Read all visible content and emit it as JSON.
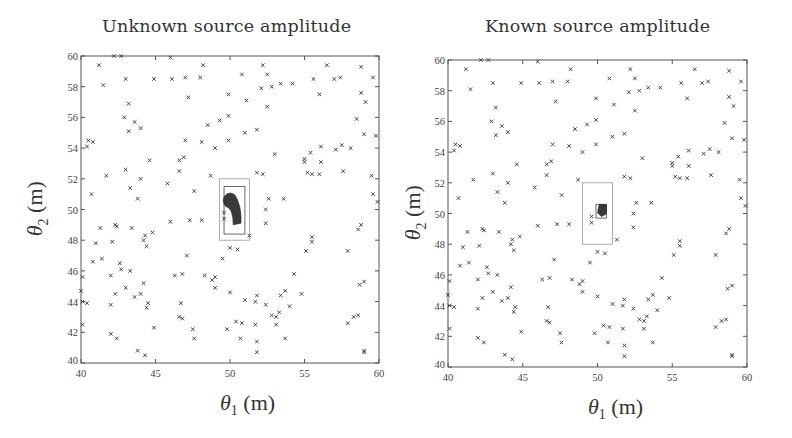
{
  "chart_data": [
    {
      "type": "scatter",
      "title": "Unknown source amplitude",
      "xlabel": "θ1 (m)",
      "ylabel": "θ2 (m)",
      "xlim": [
        40,
        60
      ],
      "ylim": [
        40,
        60
      ],
      "xticks": [
        40,
        45,
        50,
        55,
        60
      ],
      "yticks": [
        40,
        42,
        44,
        46,
        48,
        50,
        52,
        54,
        56,
        58,
        60
      ],
      "grid": false,
      "marker": "x",
      "series": [
        {
          "name": "sensors",
          "marker": "x",
          "points": "shared_sensors"
        }
      ],
      "outer_box": {
        "x": [
          49.3,
          51.3
        ],
        "y": [
          48.0,
          52.0
        ]
      },
      "inner_box": {
        "x": [
          49.6,
          51.0
        ],
        "y": [
          48.4,
          51.5
        ]
      },
      "posterior_region": {
        "center": [
          50.1,
          50.2
        ],
        "extent_x": [
          49.5,
          50.8
        ],
        "extent_y": [
          49.0,
          51.2
        ],
        "shape": "curved-crescent"
      }
    },
    {
      "type": "scatter",
      "title": "Known source amplitude",
      "xlabel": "θ1 (m)",
      "ylabel": "θ2 (m)",
      "xlim": [
        40,
        60
      ],
      "ylim": [
        40,
        60
      ],
      "xticks": [
        40,
        45,
        50,
        55,
        60
      ],
      "yticks": [
        40,
        42,
        44,
        46,
        48,
        50,
        52,
        54,
        56,
        58,
        60
      ],
      "grid": false,
      "marker": "x",
      "series": [
        {
          "name": "sensors",
          "marker": "x",
          "points": "shared_sensors"
        }
      ],
      "outer_box": {
        "x": [
          49.0,
          51.0
        ],
        "y": [
          48.0,
          52.0
        ]
      },
      "inner_box": {
        "x": [
          49.9,
          50.6
        ],
        "y": [
          49.7,
          50.6
        ]
      },
      "posterior_region": {
        "center": [
          50.3,
          50.1
        ],
        "extent_x": [
          50.0,
          50.6
        ],
        "extent_y": [
          49.8,
          50.6
        ],
        "shape": "compact-blob"
      }
    }
  ],
  "shared_sensors": [
    [
      41.2,
      59.4
    ],
    [
      42.2,
      60.0
    ],
    [
      42.7,
      60.0
    ],
    [
      46.0,
      59.9
    ],
    [
      48.2,
      59.4
    ],
    [
      52.2,
      59.4
    ],
    [
      56.5,
      59.4
    ],
    [
      58.8,
      59.3
    ],
    [
      41.5,
      58.1
    ],
    [
      43.0,
      58.5
    ],
    [
      44.9,
      58.5
    ],
    [
      46.1,
      58.5
    ],
    [
      47.0,
      58.6
    ],
    [
      48.0,
      58.6
    ],
    [
      50.8,
      58.8
    ],
    [
      52.5,
      58.8
    ],
    [
      52.1,
      57.9
    ],
    [
      52.8,
      58.0
    ],
    [
      53.4,
      58.2
    ],
    [
      54.2,
      58.2
    ],
    [
      55.6,
      58.5
    ],
    [
      57.0,
      58.5
    ],
    [
      59.6,
      58.6
    ],
    [
      56.0,
      57.5
    ],
    [
      49.9,
      57.5
    ],
    [
      51.1,
      57.1
    ],
    [
      47.2,
      57.3
    ],
    [
      43.2,
      56.9
    ],
    [
      52.5,
      56.7
    ],
    [
      58.8,
      57.6
    ],
    [
      59.1,
      57.0
    ],
    [
      57.4,
      58.6
    ],
    [
      42.9,
      56.0
    ],
    [
      43.6,
      55.7
    ],
    [
      43.2,
      55.1
    ],
    [
      44.0,
      55.3
    ],
    [
      48.5,
      55.5
    ],
    [
      49.3,
      55.8
    ],
    [
      49.9,
      56.1
    ],
    [
      51.0,
      55.0
    ],
    [
      51.8,
      55.2
    ],
    [
      58.5,
      55.9
    ],
    [
      59.0,
      54.9
    ],
    [
      59.8,
      54.8
    ],
    [
      40.5,
      54.5
    ],
    [
      40.8,
      54.4
    ],
    [
      40.4,
      54.1
    ],
    [
      47.0,
      54.5
    ],
    [
      48.1,
      54.4
    ],
    [
      49.0,
      54.0
    ],
    [
      49.9,
      54.5
    ],
    [
      53.0,
      53.6
    ],
    [
      55.0,
      53.3
    ],
    [
      55.4,
      53.7
    ],
    [
      56.1,
      54.1
    ],
    [
      57.1,
      53.9
    ],
    [
      57.5,
      54.2
    ],
    [
      58.1,
      54.0
    ],
    [
      44.6,
      53.2
    ],
    [
      46.6,
      53.2
    ],
    [
      46.9,
      53.4
    ],
    [
      55.0,
      53.1
    ],
    [
      56.1,
      53.1
    ],
    [
      40.7,
      51.0
    ],
    [
      41.7,
      52.2
    ],
    [
      43.0,
      52.6
    ],
    [
      44.0,
      52.0
    ],
    [
      45.8,
      51.7
    ],
    [
      46.6,
      52.5
    ],
    [
      48.7,
      52.2
    ],
    [
      51.8,
      52.4
    ],
    [
      52.2,
      52.3
    ],
    [
      55.2,
      52.4
    ],
    [
      55.5,
      52.3
    ],
    [
      56.0,
      52.3
    ],
    [
      57.6,
      52.5
    ],
    [
      59.5,
      52.2
    ],
    [
      43.3,
      51.4
    ],
    [
      43.8,
      50.7
    ],
    [
      47.6,
      51.2
    ],
    [
      52.6,
      50.7
    ],
    [
      53.6,
      50.7
    ],
    [
      59.6,
      51.0
    ],
    [
      59.9,
      50.5
    ],
    [
      52.4,
      50.0
    ],
    [
      42.3,
      49.0
    ],
    [
      42.4,
      48.9
    ],
    [
      41.3,
      48.8
    ],
    [
      43.4,
      48.8
    ],
    [
      44.3,
      48.3
    ],
    [
      44.8,
      48.5
    ],
    [
      46.0,
      49.2
    ],
    [
      47.3,
      49.3
    ],
    [
      48.1,
      49.3
    ],
    [
      49.6,
      49.4
    ],
    [
      49.6,
      49.8
    ],
    [
      51.3,
      48.3
    ],
    [
      52.4,
      49.1
    ],
    [
      58.6,
      48.7
    ],
    [
      58.8,
      49.0
    ],
    [
      41.0,
      47.8
    ],
    [
      42.1,
      47.9
    ],
    [
      44.2,
      48.0
    ],
    [
      44.4,
      47.6
    ],
    [
      50.0,
      47.5
    ],
    [
      50.5,
      47.4
    ],
    [
      49.5,
      46.8
    ],
    [
      47.1,
      47.0
    ],
    [
      55.1,
      47.3
    ],
    [
      55.5,
      47.9
    ],
    [
      55.5,
      48.2
    ],
    [
      57.9,
      47.3
    ],
    [
      40.8,
      46.6
    ],
    [
      41.4,
      46.8
    ],
    [
      42.6,
      46.5
    ],
    [
      42.7,
      46.1
    ],
    [
      43.3,
      46.0
    ],
    [
      40.1,
      45.6
    ],
    [
      42.0,
      45.7
    ],
    [
      46.3,
      45.7
    ],
    [
      46.8,
      45.8
    ],
    [
      48.3,
      45.7
    ],
    [
      48.8,
      45.4
    ],
    [
      49.0,
      45.6
    ],
    [
      54.3,
      45.8
    ],
    [
      58.7,
      45.1
    ],
    [
      59.0,
      45.3
    ],
    [
      43.0,
      44.9
    ],
    [
      44.2,
      45.2
    ],
    [
      49.0,
      44.9
    ],
    [
      50.0,
      44.6
    ],
    [
      53.7,
      44.7
    ],
    [
      40.0,
      44.7
    ],
    [
      42.3,
      44.5
    ],
    [
      43.6,
      44.3
    ],
    [
      44.0,
      44.5
    ],
    [
      51.8,
      44.4
    ],
    [
      53.4,
      44.4
    ],
    [
      54.8,
      44.5
    ],
    [
      40.1,
      44.0
    ],
    [
      40.4,
      43.9
    ],
    [
      42.0,
      43.8
    ],
    [
      44.5,
      43.9
    ],
    [
      44.4,
      43.6
    ],
    [
      46.7,
      43.9
    ],
    [
      51.0,
      44.1
    ],
    [
      51.7,
      44.0
    ],
    [
      52.4,
      43.8
    ],
    [
      54.0,
      43.7
    ],
    [
      46.6,
      43.0
    ],
    [
      46.8,
      42.9
    ],
    [
      52.8,
      43.1
    ],
    [
      53.1,
      43.0
    ],
    [
      53.3,
      43.3
    ],
    [
      58.3,
      43.0
    ],
    [
      58.6,
      43.1
    ],
    [
      40.1,
      42.5
    ],
    [
      44.9,
      42.3
    ],
    [
      47.5,
      42.2
    ],
    [
      49.8,
      42.2
    ],
    [
      50.4,
      42.7
    ],
    [
      50.8,
      42.6
    ],
    [
      51.7,
      42.5
    ],
    [
      53.1,
      42.5
    ],
    [
      57.9,
      42.6
    ],
    [
      42.0,
      41.9
    ],
    [
      42.4,
      41.6
    ],
    [
      47.6,
      41.6
    ],
    [
      50.7,
      41.6
    ],
    [
      51.8,
      41.4
    ],
    [
      53.7,
      41.6
    ],
    [
      43.8,
      40.8
    ],
    [
      44.3,
      40.5
    ],
    [
      51.8,
      40.7
    ],
    [
      59.0,
      40.8
    ],
    [
      59.0,
      40.7
    ]
  ],
  "panels": [
    {
      "title": "Unknown source amplitude",
      "xlabel": {
        "symbol": "θ",
        "sub": "1",
        "unit": "(m)"
      },
      "ylabel": {
        "symbol": "θ",
        "sub": "2",
        "unit": "(m)"
      },
      "xtick_labels": [
        "40",
        "45",
        "50",
        "55",
        "60"
      ],
      "ytick_labels": [
        "40",
        "42",
        "44",
        "46",
        "48",
        "50",
        "52",
        "54",
        "56",
        "58",
        "60"
      ]
    },
    {
      "title": "Known source amplitude",
      "xlabel": {
        "symbol": "θ",
        "sub": "1",
        "unit": "(m)"
      },
      "ylabel": {
        "symbol": "θ",
        "sub": "2",
        "unit": "(m)"
      },
      "xtick_labels": [
        "40",
        "45",
        "50",
        "55",
        "60"
      ],
      "ytick_labels": [
        "40",
        "42",
        "44",
        "46",
        "48",
        "50",
        "52",
        "54",
        "56",
        "58",
        "60"
      ]
    }
  ],
  "colors": {
    "axes": "#555555",
    "marker": "#333333",
    "box_outer": "#999999",
    "box_inner": "#444444",
    "posterior": "#2a2a2a"
  }
}
